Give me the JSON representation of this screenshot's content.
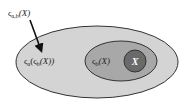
{
  "diagram": {
    "type": "nested-sets",
    "top_label": {
      "base": "ς",
      "subscript": "a,b",
      "argument": "(X)",
      "full_text": "ςa,b(X)"
    },
    "outer_set": {
      "base": "ς",
      "subscript": "a",
      "inner_base": "ς",
      "inner_subscript": "b",
      "argument": "(X))",
      "open": "(",
      "full_text": "ςa(ςb(X))",
      "fill": "#d4d4d4"
    },
    "middle_set": {
      "base": "ς",
      "subscript": "b",
      "argument": "(X)",
      "full_text": "ςb(X)",
      "fill": "#a8a8a8"
    },
    "inner_set": {
      "label": "X",
      "fill": "#6a6a6a"
    },
    "arrow": {
      "from": "top_label",
      "to": "outer_set",
      "color": "#111111"
    },
    "outline_color": "#333333"
  }
}
